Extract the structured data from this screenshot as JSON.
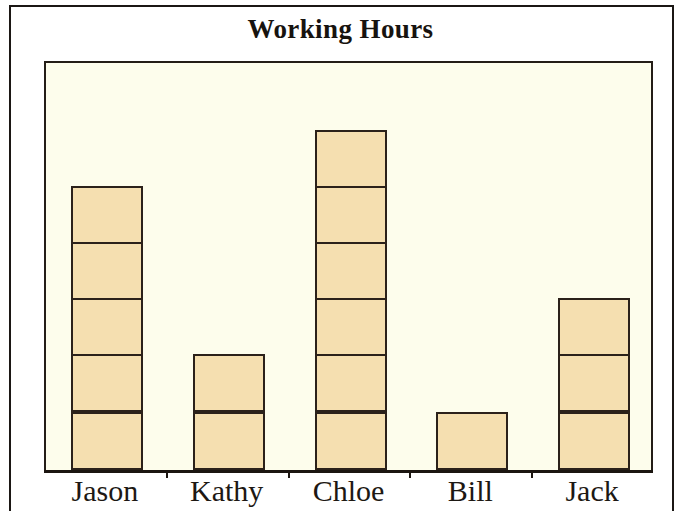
{
  "chart_data": {
    "type": "bar",
    "title": "Working Hours",
    "xlabel": "",
    "ylabel": "",
    "categories": [
      "Jason",
      "Kathy",
      "Chloe",
      "Bill",
      "Jack"
    ],
    "values": [
      5,
      2,
      6,
      1,
      3
    ],
    "unit_description": "Each bar is divided into equal square segments; one segment equals one unit of working hours.",
    "segment_counts": [
      5,
      2,
      6,
      1,
      3
    ],
    "ylim": [
      0,
      7
    ],
    "grid": false,
    "legend": null,
    "stacked_segments": true,
    "colors": {
      "bar_fill": "#F5DFB0",
      "bar_outline": "#2B211A",
      "plot_background": "#FDFDEC",
      "figure_background": "#FFFFFF",
      "axis": "#1B1510",
      "text": "#1D1813",
      "frame_border": "#1B1714"
    },
    "series": [
      {
        "name": "Working Hours",
        "values": [
          5,
          2,
          6,
          1,
          3
        ]
      }
    ],
    "bars": [
      {
        "label": "Jason",
        "value": 5,
        "segments": 5
      },
      {
        "label": "Kathy",
        "value": 2,
        "segments": 2
      },
      {
        "label": "Chloe",
        "value": 6,
        "segments": 6
      },
      {
        "label": "Bill",
        "value": 1,
        "segments": 1
      },
      {
        "label": "Jack",
        "value": 3,
        "segments": 3
      }
    ]
  },
  "axis": {
    "tick_count": 4,
    "tick_marks_between_categories": true
  }
}
